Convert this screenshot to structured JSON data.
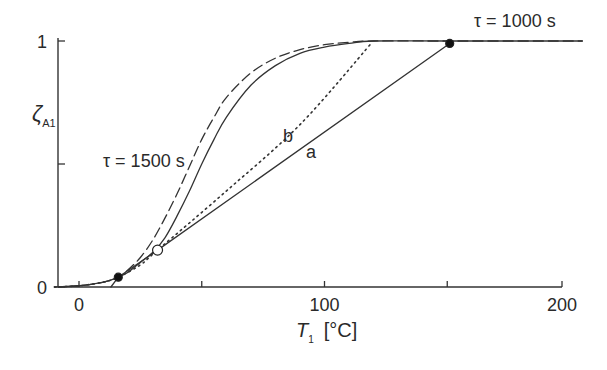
{
  "chart_data": {
    "type": "line",
    "title": "",
    "xlabel": "T1 [°C]",
    "xlabel_main": "T",
    "xlabel_sub": "1",
    "xlabel_unit": "[°C]",
    "ylabel": "ζA1",
    "ylabel_main": "ζ",
    "ylabel_sub": "A1",
    "xlim": [
      -10,
      205
    ],
    "ylim": [
      0,
      1
    ],
    "x_ticks": [
      0,
      50,
      100,
      150,
      200
    ],
    "x_tick_labels": [
      "0",
      "",
      "100",
      "",
      "200"
    ],
    "y_ticks": [
      0,
      0.5,
      1
    ],
    "y_tick_labels": [
      "0",
      "",
      "1"
    ],
    "grid": false,
    "series": [
      {
        "name": "τ = 1500 s",
        "style": "dashed",
        "x": [
          -10,
          0,
          10,
          16,
          20,
          25,
          30,
          35,
          40,
          45,
          50,
          55,
          60,
          70,
          80,
          90,
          100,
          110,
          120,
          150,
          205
        ],
        "y": [
          0,
          0.005,
          0.02,
          0.04,
          0.07,
          0.12,
          0.19,
          0.28,
          0.38,
          0.49,
          0.6,
          0.69,
          0.77,
          0.87,
          0.93,
          0.965,
          0.985,
          0.995,
          1.0,
          1.0,
          1.0
        ]
      },
      {
        "name": "τ = 1000 s",
        "style": "solid",
        "x": [
          -10,
          0,
          10,
          16,
          20,
          25,
          30,
          35,
          40,
          45,
          50,
          55,
          60,
          70,
          80,
          90,
          100,
          110,
          120,
          150,
          205
        ],
        "y": [
          0,
          0.005,
          0.02,
          0.04,
          0.06,
          0.1,
          0.14,
          0.2,
          0.29,
          0.39,
          0.5,
          0.6,
          0.69,
          0.82,
          0.9,
          0.95,
          0.975,
          0.99,
          1.0,
          1.0,
          1.0
        ]
      },
      {
        "name": "b",
        "style": "dotted",
        "x": [
          -10,
          0,
          10,
          16,
          25,
          32,
          60,
          90,
          119
        ],
        "y": [
          0,
          0.005,
          0.02,
          0.04,
          0.09,
          0.15,
          0.39,
          0.66,
          0.99
        ]
      },
      {
        "name": "a",
        "style": "solid",
        "x": [
          13,
          16,
          32,
          151
        ],
        "y": [
          0,
          0.04,
          0.15,
          0.99
        ]
      }
    ],
    "markers": [
      {
        "type": "filled",
        "x": 151,
        "y": 0.99
      },
      {
        "type": "filled",
        "x": 16,
        "y": 0.04
      },
      {
        "type": "open",
        "x": 32,
        "y": 0.15
      }
    ],
    "annotations": [
      {
        "text": "τ = 1000 s",
        "x": 155,
        "y": 1.02
      },
      {
        "text": "τ = 1500 s",
        "x": 10,
        "y": 0.52
      },
      {
        "text": "b",
        "x": 86,
        "y": 0.6
      },
      {
        "text": "a",
        "x": 95,
        "y": 0.52
      }
    ]
  }
}
